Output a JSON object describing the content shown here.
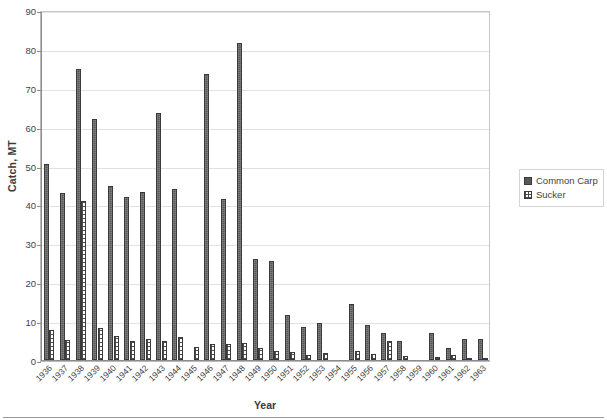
{
  "chart_data": {
    "type": "bar",
    "title": "",
    "xlabel": "Year",
    "ylabel": "Catch, MT",
    "ylim": [
      0,
      90
    ],
    "ytick_step": 10,
    "yticks": [
      0,
      10,
      20,
      30,
      40,
      50,
      60,
      70,
      80,
      90
    ],
    "grid": true,
    "legend_position": "right",
    "categories": [
      "1936",
      "1937",
      "1938",
      "1939",
      "1940",
      "1941",
      "1942",
      "1943",
      "1944",
      "1945",
      "1946",
      "1947",
      "1948",
      "1949",
      "1950",
      "1951",
      "1952",
      "1953",
      "1954",
      "1955",
      "1956",
      "1957",
      "1958",
      "1959",
      "1960",
      "1961",
      "1962",
      "1963"
    ],
    "series": [
      {
        "name": "Common Carp",
        "color": "#585858",
        "pattern": "solid-dark",
        "values": [
          50.5,
          43.0,
          74.8,
          62.0,
          44.8,
          42.0,
          43.2,
          63.5,
          44.0,
          0.0,
          73.5,
          41.5,
          81.5,
          26.0,
          25.5,
          11.5,
          8.5,
          9.5,
          0.0,
          14.5,
          9.0,
          7.0,
          5.0,
          0.0,
          7.0,
          3.0,
          5.5,
          5.5
        ]
      },
      {
        "name": "Sucker",
        "color": "#ffffff",
        "pattern": "dotted-grid",
        "values": [
          7.8,
          5.2,
          41.0,
          8.2,
          6.2,
          5.0,
          5.5,
          4.8,
          5.8,
          3.3,
          4.0,
          4.2,
          4.5,
          3.2,
          2.4,
          2.0,
          1.3,
          1.8,
          0.0,
          2.2,
          1.5,
          4.8,
          1.0,
          0.0,
          0.7,
          1.2,
          0.6,
          0.5
        ]
      }
    ]
  },
  "legend": {
    "items": [
      {
        "label": "Common Carp"
      },
      {
        "label": "Sucker"
      }
    ]
  },
  "axes": {
    "y_title": "Catch, MT",
    "x_title": "Year"
  }
}
